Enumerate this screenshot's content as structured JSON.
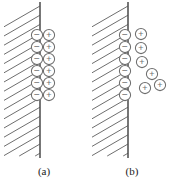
{
  "figure": {
    "background_color": "#ffffff",
    "width": 177,
    "height": 185,
    "ink_color": "#6e6e6e",
    "wall_color": "#555555",
    "caption_color": "#1a1a1a"
  },
  "panels": [
    {
      "id": "a",
      "caption": "(a)",
      "model_name": "compact-helmholtz-layer",
      "wall": {
        "x": 40,
        "y_top": 2,
        "y_bottom": 158,
        "line_width": 1.6
      },
      "hatch": {
        "angle_deg": 30,
        "line_count": 16,
        "spacing": 9.2,
        "x_right": 40,
        "y_top": 6,
        "y_bottom": 156,
        "stroke_width": 1.0
      },
      "charges": {
        "negative_label": "−",
        "positive_label": "+",
        "radius": 5.6,
        "negative": [
          {
            "cx": 37,
            "cy": 35
          },
          {
            "cx": 37,
            "cy": 47
          },
          {
            "cx": 37,
            "cy": 59
          },
          {
            "cx": 37,
            "cy": 71
          },
          {
            "cx": 37,
            "cy": 83
          },
          {
            "cx": 37,
            "cy": 95
          }
        ],
        "positive": [
          {
            "cx": 49,
            "cy": 35
          },
          {
            "cx": 49,
            "cy": 47
          },
          {
            "cx": 49,
            "cy": 59
          },
          {
            "cx": 49,
            "cy": 71
          },
          {
            "cx": 49,
            "cy": 83
          },
          {
            "cx": 49,
            "cy": 95
          }
        ]
      }
    },
    {
      "id": "b",
      "caption": "(b)",
      "model_name": "diffuse-gouy-chapman-layer",
      "wall": {
        "x": 128,
        "y_top": 2,
        "y_bottom": 158,
        "line_width": 1.6
      },
      "hatch": {
        "angle_deg": 30,
        "line_count": 16,
        "spacing": 9.2,
        "x_right": 128,
        "y_top": 6,
        "y_bottom": 156,
        "stroke_width": 1.0
      },
      "charges": {
        "negative_label": "−",
        "positive_label": "+",
        "radius": 5.6,
        "negative": [
          {
            "cx": 125,
            "cy": 35
          },
          {
            "cx": 125,
            "cy": 47
          },
          {
            "cx": 125,
            "cy": 59
          },
          {
            "cx": 125,
            "cy": 71
          },
          {
            "cx": 125,
            "cy": 83
          },
          {
            "cx": 125,
            "cy": 95
          }
        ],
        "positive": [
          {
            "cx": 141,
            "cy": 34
          },
          {
            "cx": 141,
            "cy": 48
          },
          {
            "cx": 142,
            "cy": 62
          },
          {
            "cx": 152,
            "cy": 74
          },
          {
            "cx": 145,
            "cy": 88
          },
          {
            "cx": 160,
            "cy": 85
          }
        ]
      }
    }
  ]
}
